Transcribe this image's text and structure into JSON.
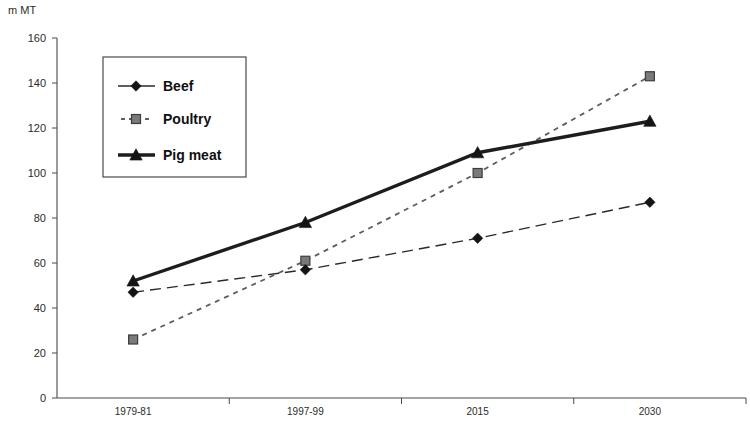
{
  "chart_data": {
    "type": "line",
    "title": "",
    "subtitle": "",
    "xlabel": "",
    "ylabel": "m MT",
    "ylim": [
      0,
      160
    ],
    "yticks": [
      0,
      20,
      40,
      60,
      80,
      100,
      120,
      140,
      160
    ],
    "ytick_labels": [
      "0",
      "20",
      "40",
      "60",
      "80",
      "100",
      "120",
      "140",
      "160"
    ],
    "categories": [
      "1979-81",
      "1997-99",
      "2015",
      "2030"
    ],
    "grid": false,
    "legend_position": "upper-left-inside",
    "series": [
      {
        "name": "Beef",
        "marker": "diamond",
        "line_style": "long-dashed",
        "color": "#2a2a2a",
        "values": [
          47,
          57,
          71,
          87
        ]
      },
      {
        "name": "Poultry",
        "marker": "square",
        "line_style": "dotted",
        "color": "#7a7a7a",
        "values": [
          26,
          61,
          100,
          143
        ]
      },
      {
        "name": "Pig meat",
        "marker": "triangle",
        "line_style": "solid-thick",
        "color": "#1d1d1d",
        "values": [
          52,
          78,
          109,
          123
        ]
      }
    ]
  },
  "axis": {
    "y_title": "m MT"
  },
  "legend": {
    "items": [
      {
        "label": "Beef"
      },
      {
        "label": "Poultry"
      },
      {
        "label": "Pig meat"
      }
    ]
  }
}
